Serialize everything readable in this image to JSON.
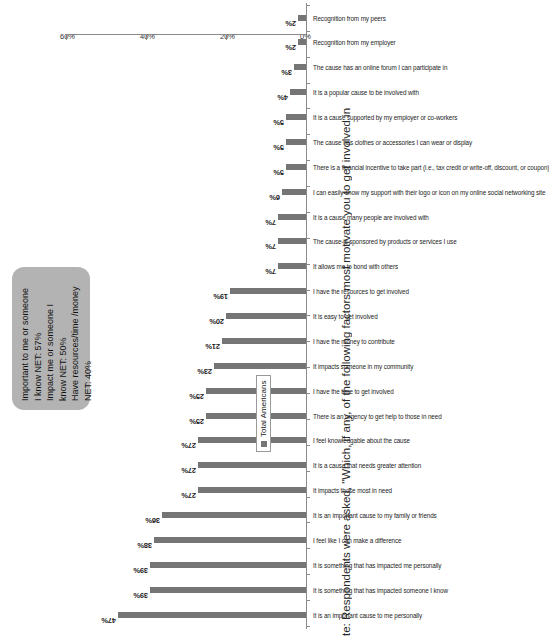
{
  "chart_data": {
    "type": "bar",
    "title": "",
    "xlabel": "",
    "ylabel": "",
    "ylim": [
      0,
      60
    ],
    "grid": false,
    "orientation": "vertical",
    "legend_position": "bottom-right",
    "axis_ticks": [
      "0%",
      "20%",
      "40%",
      "60%"
    ],
    "axis_tick_values": [
      0,
      20,
      40,
      60
    ],
    "series": [
      {
        "name": "Total Americans",
        "color": "#757575",
        "values": [
          47,
          39,
          39,
          38,
          36,
          27,
          27,
          27,
          25,
          25,
          23,
          21,
          20,
          19,
          7,
          7,
          7,
          6,
          5,
          5,
          5,
          4,
          3,
          2,
          2
        ]
      }
    ],
    "categories": [
      "It is an important cause to me personally",
      "It is something that has impacted someone I know",
      "It is something that has impacted me personally",
      "I feel like I can make a difference",
      "It is an important cause to my family or friends",
      "It impacts those most in need",
      "It is a cause that needs greater attention",
      "I feel knowledgable  about the cause",
      "There is an urgency to get help to those in need",
      "I have the time to get involved",
      "It impacts someone in my community",
      "I have the money to contribute",
      "It is easy to get involved",
      "I have the resources to get involved",
      "It allows me to bond with others",
      "The cause is sponsored by products or services I use",
      "It is a cause many people are involved with",
      "I can easily show my support with their logo or icon on my online social networking site",
      "There is a financial incentive to take part (i.e., tax credit or write-off, discount, or coupon)",
      "The cause has clothes or accessories I can wear or display",
      "It is a cause supported by my employer or co-workers",
      "It is a popular cause to be involved with",
      "The cause has an online forum I can participate in",
      "Recognition from my employer",
      "Recognition from my peers"
    ],
    "data_labels": [
      "47%",
      "39%",
      "39%",
      "38%",
      "36%",
      "27%",
      "27%",
      "27%",
      "25%",
      "25%",
      "23%",
      "21%",
      "20%",
      "19%",
      "7%",
      "7%",
      "7%",
      "6%",
      "5%",
      "5%",
      "5%",
      "4%",
      "3%",
      "2%",
      "2%"
    ]
  },
  "callout": {
    "line1": "Important to me or someone",
    "line2": "I know NET: 57%",
    "line3": "Impact me or someone I",
    "line4": "know NET: 50%",
    "line5": "Have resources/time /money",
    "line6": "NET: 40%",
    "background_color": "#b3b3b3"
  },
  "legend": {
    "label": "Total Americans",
    "swatch_color": "#757575"
  },
  "footnote": {
    "text": "te: Respondents were asked, \"Which, if any, of the following factors most motivate you to get involved in"
  }
}
